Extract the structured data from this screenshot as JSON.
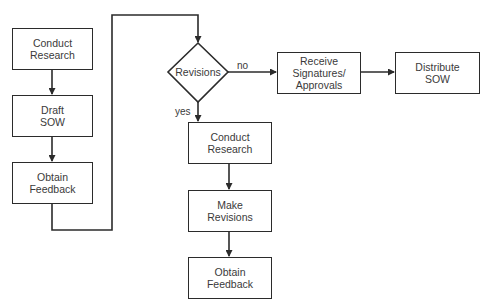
{
  "flowchart": {
    "left_column": [
      {
        "id": "conduct-research-1",
        "label": "Conduct\nResearch"
      },
      {
        "id": "draft-sow",
        "label": "Draft\nSOW"
      },
      {
        "id": "obtain-feedback-1",
        "label": "Obtain\nFeedback"
      }
    ],
    "decision": {
      "id": "revisions",
      "label": "Revisions"
    },
    "edge_labels": {
      "no": "no",
      "yes": "yes"
    },
    "top_row": [
      {
        "id": "receive-signatures",
        "label": "Receive\nSignatures/\nApprovals"
      },
      {
        "id": "distribute-sow",
        "label": "Distribute\nSOW"
      }
    ],
    "right_column": [
      {
        "id": "conduct-research-2",
        "label": "Conduct\nResearch"
      },
      {
        "id": "make-revisions",
        "label": "Make\nRevisions"
      },
      {
        "id": "obtain-feedback-2",
        "label": "Obtain\nFeedback"
      }
    ],
    "colors": {
      "stroke": "#2b2b2b",
      "text": "#3a3a3a",
      "background": "#ffffff"
    }
  }
}
